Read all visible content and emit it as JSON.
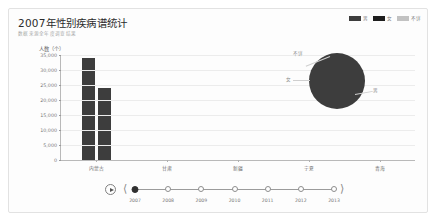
{
  "header": {
    "title": "2007年性别疾病谱统计",
    "subtitle": "数据来源全年度调查结果"
  },
  "legend": {
    "items": [
      {
        "label": "男",
        "color": "#3d3d3d"
      },
      {
        "label": "女",
        "color": "#1e1e1e"
      },
      {
        "label": "不详",
        "color": "#c2c2c2"
      }
    ]
  },
  "chart_data": {
    "type": "bar",
    "title": "2007年性别疾病谱统计",
    "xlabel": "",
    "ylabel": "人数（个）",
    "ylim": [
      0,
      35000
    ],
    "ytick_labels": [
      "35,000",
      "30,000",
      "25,000",
      "20,000",
      "15,000",
      "10,000",
      "5,000",
      "0"
    ],
    "ytick_values": [
      35000,
      30000,
      25000,
      20000,
      15000,
      10000,
      5000,
      0
    ],
    "grid": true,
    "legend_position": "top-right",
    "categories": [
      "内蒙古",
      "甘肃",
      "新疆",
      "宁夏",
      "青海"
    ],
    "series": [
      {
        "name": "男",
        "color": "#3d3d3d",
        "values": [
          34000,
          0,
          0,
          0,
          0
        ]
      },
      {
        "name": "女",
        "color": "#3d3d3d",
        "values": [
          24000,
          0,
          0,
          0,
          0
        ]
      },
      {
        "name": "不详",
        "color": "#c2c2c2",
        "values": [
          0,
          0,
          0,
          0,
          0
        ]
      }
    ]
  },
  "pie_data": {
    "type": "pie",
    "slices": [
      {
        "label": "男",
        "color": "#3d3d3d",
        "percent": 58
      },
      {
        "label": "女",
        "color": "#3d3d3d",
        "percent": 41
      },
      {
        "label": "不详",
        "color": "#c2c2c2",
        "percent": 1
      }
    ],
    "labels": {
      "top": "不详",
      "left": "女",
      "right": "男"
    }
  },
  "timeline": {
    "play_icon": "play-icon",
    "prev_icon": "chevron-left-icon",
    "next_icon": "chevron-right-icon",
    "selected": "2007",
    "years": [
      "2007",
      "2008",
      "2009",
      "2010",
      "2011",
      "2012",
      "2013"
    ]
  }
}
